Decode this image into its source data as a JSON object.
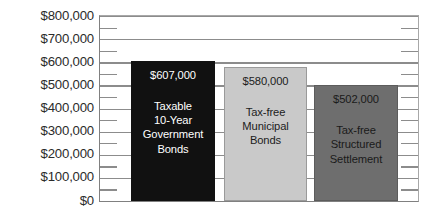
{
  "chart_data": {
    "type": "bar",
    "title": "",
    "subtitle": "",
    "xlabel": "",
    "ylabel": "",
    "ylim": [
      0,
      800000
    ],
    "ytick_labels": [
      "$800,000",
      "$700,000",
      "$600,000",
      "$500,000",
      "$400,000",
      "$300,000",
      "$200,000",
      "$100,000",
      "$0"
    ],
    "ytick_values": [
      800000,
      700000,
      600000,
      500000,
      400000,
      300000,
      200000,
      100000,
      0
    ],
    "minor_tick_interval": 50000,
    "grid": true,
    "legend": "none",
    "categories": [
      "Taxable 10-Year Government Bonds",
      "Tax-free Municipal Bonds",
      "Tax-free Structured Settlement"
    ],
    "values": [
      607000,
      580000,
      502000
    ],
    "value_labels": [
      "$607,000",
      "$580,000",
      "$502,000"
    ],
    "bars": [
      {
        "value": 607000,
        "value_label": "$607,000",
        "caption_lines": [
          "Taxable",
          "10-Year",
          "Government",
          "Bonds"
        ],
        "fill_color": "#111111",
        "border_color": "#111111",
        "text_color": "#ffffff"
      },
      {
        "value": 580000,
        "value_label": "$580,000",
        "caption_lines": [
          "Tax-free",
          "Municipal",
          "Bonds"
        ],
        "fill_color": "#c9c9c9",
        "border_color": "#9a9a9a",
        "text_color": "#1c1c1c"
      },
      {
        "value": 502000,
        "value_label": "$502,000",
        "caption_lines": [
          "Tax-free",
          "Structured",
          "Settlement"
        ],
        "fill_color": "#6e6e6e",
        "border_color": "#5c5c5c",
        "text_color": "#1a1a1a"
      }
    ],
    "axis_color": "#8c8c8c",
    "background_color": "#ffffff"
  }
}
